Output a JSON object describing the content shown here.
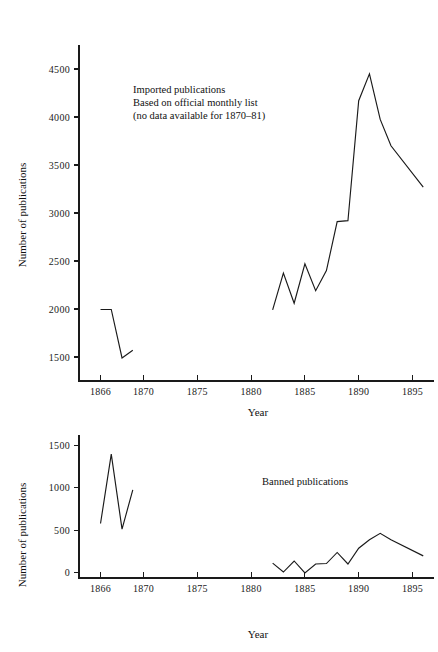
{
  "chart_data": [
    {
      "id": "imported-publications",
      "type": "line",
      "title": "",
      "annotation": [
        "Imported publications",
        "Based on official monthly list",
        "(no data available for 1870–81)"
      ],
      "xlabel": "Year",
      "ylabel": "Number of publications",
      "xlim": [
        1864,
        1897
      ],
      "ylim": [
        1250,
        4750
      ],
      "xticks": [
        1866,
        1870,
        1875,
        1880,
        1885,
        1890,
        1895
      ],
      "xtick_labels": [
        "1866",
        "1870",
        "1875",
        "1880",
        "1885",
        "1890",
        "1895"
      ],
      "yticks": [
        1500,
        2000,
        2500,
        3000,
        3500,
        4000,
        4500
      ],
      "ytick_labels": [
        "1500",
        "2000",
        "2500",
        "3000",
        "3500",
        "4000",
        "4500"
      ],
      "grid": false,
      "legend": "none",
      "series": [
        {
          "name": "Imported publications 1866-1869",
          "x": [
            1866,
            1867,
            1868,
            1869
          ],
          "values": [
            1995,
            1995,
            1490,
            1570
          ]
        },
        {
          "name": "Imported publications 1882-1896",
          "x": [
            1882,
            1883,
            1884,
            1885,
            1886,
            1887,
            1888,
            1889,
            1890,
            1891,
            1892,
            1893,
            1896
          ],
          "values": [
            1990,
            2375,
            2060,
            2470,
            2190,
            2400,
            2910,
            2920,
            4170,
            4450,
            3975,
            3700,
            3270
          ]
        }
      ]
    },
    {
      "id": "banned-publications",
      "type": "line",
      "title": "",
      "annotation": [
        "Banned publications"
      ],
      "xlabel": "Year",
      "ylabel": "Number of publications",
      "xlim": [
        1864,
        1897
      ],
      "ylim": [
        -60,
        1620
      ],
      "xticks": [
        1866,
        1870,
        1875,
        1880,
        1885,
        1890,
        1895
      ],
      "xtick_labels": [
        "1866",
        "1870",
        "1875",
        "1880",
        "1885",
        "1890",
        "1895"
      ],
      "yticks": [
        0,
        500,
        1000,
        1500
      ],
      "ytick_labels": [
        "0",
        "500",
        "1000",
        "1500"
      ],
      "grid": false,
      "legend": "none",
      "series": [
        {
          "name": "Banned publications 1866-1869",
          "x": [
            1866,
            1867,
            1868,
            1869
          ],
          "values": [
            580,
            1395,
            515,
            975
          ]
        },
        {
          "name": "Banned publications 1882-1896",
          "x": [
            1882,
            1883,
            1884,
            1885,
            1886,
            1887,
            1888,
            1889,
            1890,
            1891,
            1892,
            1893,
            1896
          ],
          "values": [
            115,
            10,
            140,
            0,
            105,
            110,
            240,
            105,
            290,
            390,
            465,
            390,
            200
          ]
        }
      ]
    }
  ],
  "colors": {
    "line": "#1a1a1a",
    "axis": "#1a1a1a",
    "text": "#111111",
    "background": "#ffffff"
  }
}
